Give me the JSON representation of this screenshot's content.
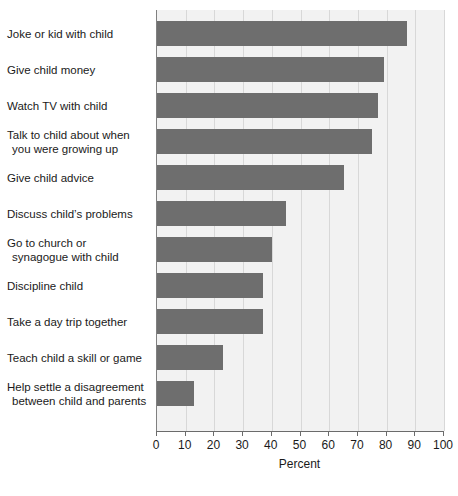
{
  "chart_data": {
    "type": "bar",
    "orientation": "horizontal",
    "title": "",
    "xlabel": "Percent",
    "ylabel": "",
    "xlim": [
      0,
      100
    ],
    "xticks": [
      0,
      10,
      20,
      30,
      40,
      50,
      60,
      70,
      80,
      90,
      100
    ],
    "grid": true,
    "legend": null,
    "bar_color": "#6e6e6e",
    "plot_background": "#f2f2f2",
    "categories": [
      "Joke or kid with child",
      "Give child money",
      "Watch TV with child",
      "Talk to child about when you were growing up",
      "Give child advice",
      "Discuss child's problems",
      "Go to church or synagogue with child",
      "Discipline child",
      "Take a day trip together",
      "Teach child a skill or game",
      "Help settle a disagreement between child and parents"
    ],
    "values": [
      87,
      79,
      77,
      75,
      65,
      45,
      40,
      37,
      37,
      23,
      13
    ]
  },
  "categories_wrapped": [
    {
      "line1": "Joke or kid with child",
      "line2": ""
    },
    {
      "line1": "Give child money",
      "line2": ""
    },
    {
      "line1": "Watch TV with child",
      "line2": ""
    },
    {
      "line1": "Talk to child about when",
      "line2": "you were growing up"
    },
    {
      "line1": "Give child advice",
      "line2": ""
    },
    {
      "line1": "Discuss child’s problems",
      "line2": ""
    },
    {
      "line1": "Go to church or",
      "line2": "synagogue with child"
    },
    {
      "line1": "Discipline child",
      "line2": ""
    },
    {
      "line1": "Take a day trip together",
      "line2": ""
    },
    {
      "line1": "Teach child a skill or game",
      "line2": ""
    },
    {
      "line1": "Help settle a disagreement",
      "line2": "between child and parents"
    }
  ],
  "margin_fragment": ""
}
